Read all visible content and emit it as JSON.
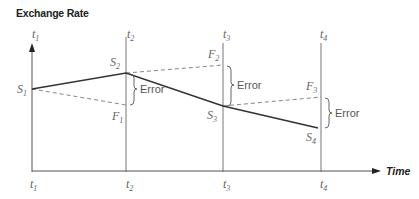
{
  "title": "Exchange Rate",
  "x_axis_label": "Time",
  "time_points": [
    {
      "label": "t",
      "sub": "1"
    },
    {
      "label": "t",
      "sub": "2"
    },
    {
      "label": "t",
      "sub": "3"
    },
    {
      "label": "t",
      "sub": "4"
    }
  ],
  "spot_rates": [
    {
      "label": "S",
      "sub": "1"
    },
    {
      "label": "S",
      "sub": "2"
    },
    {
      "label": "S",
      "sub": "3"
    },
    {
      "label": "S",
      "sub": "4"
    }
  ],
  "forward_rates": [
    {
      "label": "F",
      "sub": "1"
    },
    {
      "label": "F",
      "sub": "2"
    },
    {
      "label": "F",
      "sub": "3"
    }
  ],
  "error_labels": [
    "Error",
    "Error",
    "Error"
  ],
  "colors": {
    "spot_line": "#333333",
    "forward_line": "#777777",
    "axis": "#555555"
  }
}
